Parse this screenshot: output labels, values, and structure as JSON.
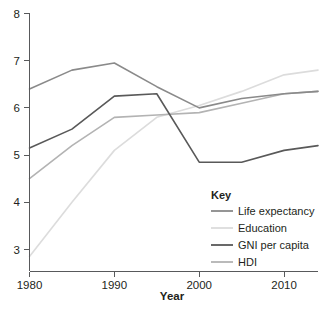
{
  "chart_data": {
    "type": "line",
    "title": "",
    "xlabel": "Year",
    "ylabel": "",
    "x": [
      1980,
      1985,
      1990,
      1995,
      2000,
      2005,
      2010,
      2014
    ],
    "xlim": [
      1980,
      2014
    ],
    "ylim": [
      3,
      8
    ],
    "xticks": [
      1980,
      1990,
      2000,
      2010
    ],
    "yticks": [
      3,
      4,
      5,
      6,
      7,
      8
    ],
    "grid": false,
    "legend_position": "bottom-right",
    "legend_title": "Key",
    "series": [
      {
        "name": "Life expectancy",
        "color": "#8a8a8a",
        "values": [
          6.4,
          6.8,
          6.95,
          6.45,
          6.0,
          6.2,
          6.3,
          6.35
        ]
      },
      {
        "name": "Education",
        "color": "#dcdcdc",
        "values": [
          2.85,
          4.0,
          5.1,
          5.8,
          6.05,
          6.35,
          6.7,
          6.8
        ]
      },
      {
        "name": "GNI per capita",
        "color": "#595959",
        "values": [
          5.15,
          5.55,
          6.25,
          6.3,
          4.85,
          4.85,
          5.1,
          5.2
        ]
      },
      {
        "name": "HDI",
        "color": "#b3b3b3",
        "values": [
          4.5,
          5.2,
          5.8,
          5.85,
          5.9,
          6.1,
          6.3,
          6.35
        ]
      }
    ]
  },
  "axes": {
    "x_tick_labels": [
      "1980",
      "1990",
      "2000",
      "2010"
    ],
    "y_tick_labels": [
      "3",
      "4",
      "5",
      "6",
      "7",
      "8"
    ],
    "x_axis_title": "Year"
  },
  "legend": {
    "title": "Key",
    "entries": [
      {
        "label": "Life expectancy",
        "color": "#8a8a8a"
      },
      {
        "label": "Education",
        "color": "#dcdcdc"
      },
      {
        "label": "GNI per capita",
        "color": "#595959"
      },
      {
        "label": "HDI",
        "color": "#b3b3b3"
      }
    ]
  },
  "colors": {
    "axis": "#58595b",
    "text": "#231f20",
    "background": "#ffffff"
  }
}
